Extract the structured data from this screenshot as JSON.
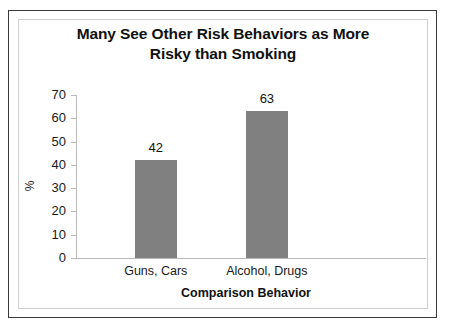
{
  "chart_data": {
    "type": "bar",
    "title": "Many See Other Risk Behaviors as More Risky than Smoking",
    "title_lines": [
      "Many See Other Risk Behaviors as More",
      "Risky than Smoking"
    ],
    "categories": [
      "Guns, Cars",
      "Alcohol, Drugs"
    ],
    "values": [
      42,
      63
    ],
    "data_labels": [
      "42",
      "63"
    ],
    "xlabel": "Comparison Behavior",
    "ylabel": "%",
    "ylim": [
      0,
      70
    ],
    "yticks": [
      70,
      60,
      50,
      40,
      30,
      20,
      10,
      0
    ],
    "ytick_labels": [
      "70",
      "60",
      "50",
      "40",
      "30",
      "20",
      "10",
      "0"
    ],
    "grid": false,
    "legend": false,
    "bar_color": "#808080",
    "axis_color": "#b9b9b9",
    "text_color": "#111111",
    "background": "#ffffff"
  },
  "frame": {
    "outer_border_color": "#3a3a3a",
    "inner_border_color": "#cfcfcf"
  }
}
